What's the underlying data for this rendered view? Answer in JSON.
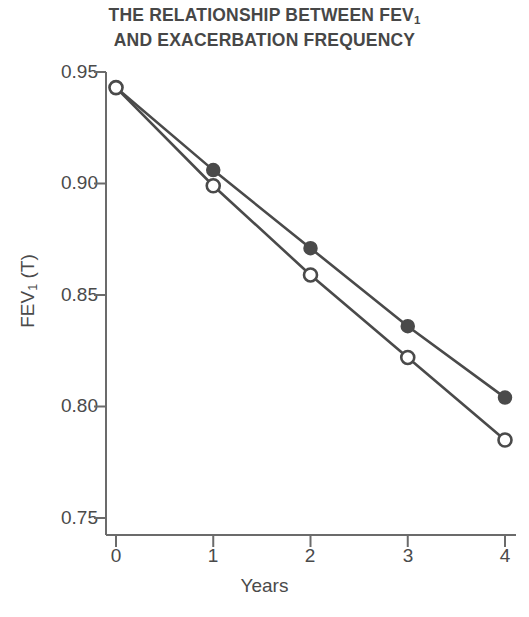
{
  "chart_data": {
    "type": "line",
    "title": "THE RELATIONSHIP BETWEEN FEV1 AND EXACERBATION FREQUENCY",
    "title_lines": [
      "THE RELATIONSHIP BETWEEN FEV",
      "AND EXACERBATION FREQUENCY"
    ],
    "title_sub": "1",
    "xlabel": "Years",
    "ylabel": "FEV",
    "ylabel_sub": "1",
    "ylabel_suffix": " (T)",
    "x": [
      0,
      1,
      2,
      3,
      4
    ],
    "xlim": [
      0,
      4
    ],
    "ylim": [
      0.75,
      0.95
    ],
    "xticks": [
      "0",
      "1",
      "2",
      "3",
      "4"
    ],
    "yticks": [
      "0.95",
      "0.90",
      "0.85",
      "0.80",
      "0.75"
    ],
    "grid": false,
    "legend": "none",
    "series": [
      {
        "name": "infrequent-exacerbations",
        "marker": "filled-circle",
        "color": "#4a4a4a",
        "values": [
          0.943,
          0.906,
          0.871,
          0.836,
          0.804
        ]
      },
      {
        "name": "frequent-exacerbations",
        "marker": "open-circle",
        "color": "#4a4a4a",
        "values": [
          0.943,
          0.899,
          0.859,
          0.822,
          0.785
        ]
      }
    ]
  },
  "axis": {
    "line_color": "#6b6b6b",
    "tick_color": "#6b6b6b"
  }
}
